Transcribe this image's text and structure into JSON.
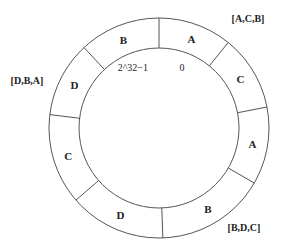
{
  "diagram": {
    "center": {
      "x": 159,
      "y": 128
    },
    "outer_radius": 110,
    "inner_radius": 80,
    "stroke_color": "#555555",
    "divider_angles_deg": [
      90,
      51,
      11,
      -30,
      -88,
      -139,
      173,
      133
    ],
    "segments": [
      {
        "label": "A",
        "angle": 70
      },
      {
        "label": "C",
        "angle": 31
      },
      {
        "label": "A",
        "angle": -10
      },
      {
        "label": "B",
        "angle": -59
      },
      {
        "label": "D",
        "angle": -114
      },
      {
        "label": "C",
        "angle": -163
      },
      {
        "label": "D",
        "angle": 153
      },
      {
        "label": "B",
        "angle": 112
      }
    ],
    "ring_tokens": {
      "max": "2^32−1",
      "zero": "0"
    },
    "replica_groups": [
      {
        "label": "[A,C,B]",
        "x": 248,
        "y": 22
      },
      {
        "label": "[D,B,A]",
        "x": 27,
        "y": 84
      },
      {
        "label": "[B,D,C]",
        "x": 244,
        "y": 231
      }
    ]
  }
}
